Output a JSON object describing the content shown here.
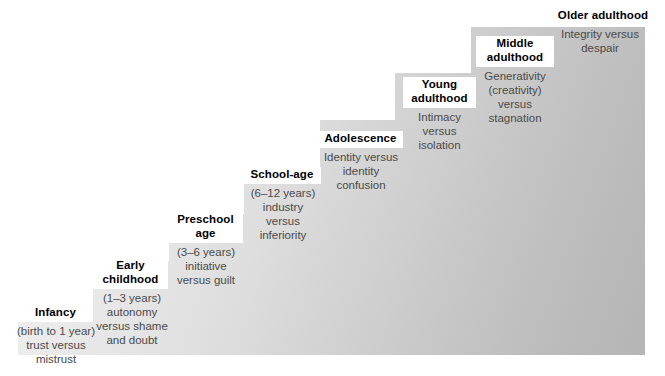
{
  "figure": {
    "kind": "staircase-diagram",
    "background_color": "#ffffff",
    "gradient_from": "#f2f2f2",
    "gradient_to": "#b5b5b5",
    "title_color": "#000000",
    "body_color": "#4a4a4a"
  },
  "stages": [
    {
      "id": "infancy",
      "title": "Infancy",
      "age": "(birth to 1 year)",
      "crisis": "trust versus\nmistrust",
      "body": "(birth to 1 year)\ntrust versus\nmistrust"
    },
    {
      "id": "early-childhood",
      "title": "Early\nchildhood",
      "age": "(1–3 years)",
      "crisis": "autonomy\nversus shame\nand doubt",
      "body": "(1–3 years)\nautonomy\nversus shame\nand doubt"
    },
    {
      "id": "preschool-age",
      "title": "Preschool\nage",
      "age": "(3–6 years)",
      "crisis": "initiative\nversus guilt",
      "body": "(3–6 years)\ninitiative\nversus guilt"
    },
    {
      "id": "school-age",
      "title": "School-age",
      "age": "(6–12 years)",
      "crisis": "industry\nversus\ninferiority",
      "body": "(6–12 years)\nindustry\nversus\ninferiority"
    },
    {
      "id": "adolescence",
      "title": "Adolescence",
      "age": "",
      "crisis": "Identity versus\nidentity\nconfusion",
      "body": "Identity versus\nidentity\nconfusion"
    },
    {
      "id": "young-adulthood",
      "title": "Young\nadulthood",
      "age": "",
      "crisis": "Intimacy\nversus\nisolation",
      "body": "Intimacy\nversus\nisolation"
    },
    {
      "id": "middle-adulthood",
      "title": "Middle\nadulthood",
      "age": "",
      "crisis": "Generativity\n(creativity)\nversus\nstagnation",
      "body": "Generativity\n(creativity)\nversus\nstagnation"
    },
    {
      "id": "older-adulthood",
      "title": "Older adulthood",
      "age": "",
      "crisis": "Integrity versus\ndespair",
      "body": "Integrity versus\ndespair"
    }
  ]
}
